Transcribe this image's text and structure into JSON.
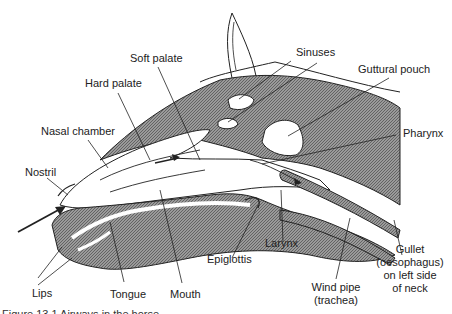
{
  "diagram": {
    "labels": {
      "soft_palate": "Soft palate",
      "hard_palate": "Hard palate",
      "nasal_chamber": "Nasal chamber",
      "nostril": "Nostril",
      "lips": "Lips",
      "tongue": "Tongue",
      "mouth": "Mouth",
      "epiglottis": "Epiglottis",
      "larynx": "Larynx",
      "wind_pipe_1": "Wind pipe",
      "wind_pipe_2": "(trachea)",
      "gullet_1": "Gullet",
      "gullet_2": "(oesophagus)",
      "gullet_3": "on left side",
      "gullet_4": "of neck",
      "sinuses": "Sinuses",
      "guttural_pouch": "Guttural pouch",
      "pharynx": "Pharynx"
    },
    "caption": "Figure 13.1 Airways in the horse"
  }
}
